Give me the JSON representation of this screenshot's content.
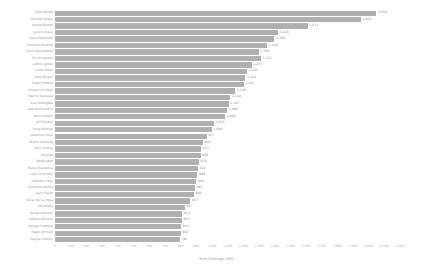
{
  "chart_data": {
    "type": "bar",
    "orientation": "horizontal",
    "title": "",
    "xlabel": "Total Earnings ($M)",
    "ylabel": "",
    "xlim": [
      0,
      2200
    ],
    "grid": false,
    "legend": null,
    "bar_color": "#b0b0b0",
    "label_color": "#9a9a9a",
    "xticks": [
      0,
      100,
      200,
      300,
      400,
      500,
      600,
      700,
      800,
      900,
      1000,
      1100,
      1200,
      1300,
      1400,
      1500,
      1600,
      1700,
      1800,
      1900,
      2000,
      2100,
      2200
    ],
    "xticklabels": [
      "0",
      "100",
      "200",
      "300",
      "400",
      "500",
      "600",
      "700",
      "800",
      "900",
      "1,000",
      "1,100",
      "1,200",
      "1,300",
      "1,400",
      "1,500",
      "1,600",
      "1,700",
      "1,800",
      "1,900",
      "2,000",
      "2,100",
      "2,200"
    ],
    "categories": [
      "Tiger Woods",
      "Michael Jordan",
      "Arnold Palmer",
      "Jack Nicklaus",
      "David Beckham",
      "Cristiano Ronaldo",
      "Floyd Mayweather",
      "Phil Mickelson",
      "LeBron James",
      "Lionel Messi",
      "Kobe Bryant",
      "Roger Federer",
      "Shaquille O'Neal",
      "Manny Pacquiao",
      "Alex Rodriguez",
      "Dale Earnhardt Jr",
      "Kevin Durant",
      "Jeff Gordon",
      "Greg Norman",
      "Valentino Rossi",
      "Peyton Manning",
      "Rory McIlroy",
      "Neymar",
      "Derek Jeter",
      "Maria Sharapova",
      "Lewis Hamilton",
      "Stephen Curry",
      "Fernando Alonso",
      "Gary Player",
      "Oscar De La Hoya",
      "Tom Brady",
      "Novak Djokovic",
      "Serena Williams",
      "George Foreman",
      "Magic Johnson",
      "Wayne Gretzky"
    ],
    "values": [
      2050,
      1950,
      1611,
      1423,
      1399,
      1349,
      1300,
      1315,
      1255,
      1226,
      1214,
      1207,
      1149,
      1118,
      1107,
      1098,
      1086,
      1013,
      1000,
      967,
      946,
      933,
      928,
      919,
      912,
      908,
      902,
      893,
      886,
      863,
      827,
      813,
      810,
      804,
      802,
      796
    ],
    "value_labels": [
      "2,050",
      "1,950",
      "1,611",
      "1,423",
      "1,399",
      "1,349",
      "1,300",
      "1,315",
      "1,255",
      "1,226",
      "1,214",
      "1,207",
      "1,149",
      "1,118",
      "1,107",
      "1,098",
      "1,086",
      "1,013",
      "1,000",
      "967",
      "946",
      "933",
      "928",
      "919",
      "912",
      "908",
      "902",
      "893",
      "886",
      "863",
      "827",
      "813",
      "810",
      "804",
      "802",
      "796"
    ]
  }
}
